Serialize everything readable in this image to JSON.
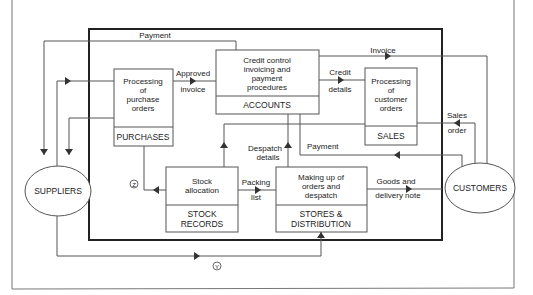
{
  "diagram": {
    "type": "data-flow-diagram",
    "entities": {
      "suppliers": "SUPPLIERS",
      "customers": "CUSTOMERS"
    },
    "processes": [
      {
        "id": "purchases",
        "text": [
          "Processing",
          "of",
          "purchase",
          "orders"
        ],
        "department": "PURCHASES"
      },
      {
        "id": "accounts",
        "text": [
          "Credit control",
          "invoicing and",
          "payment",
          "procedures"
        ],
        "department": "ACCOUNTS"
      },
      {
        "id": "sales",
        "text": [
          "Processing",
          "of",
          "customer",
          "orders"
        ],
        "department": "SALES"
      },
      {
        "id": "stock",
        "text": [
          "Stock",
          "allocation"
        ],
        "department": [
          "STOCK",
          "RECORDS"
        ]
      },
      {
        "id": "stores",
        "text": [
          "Making up of",
          "orders and",
          "despatch"
        ],
        "department": [
          "STORES &",
          "DISTRIBUTION"
        ]
      }
    ],
    "flows": {
      "payment_top": "Payment",
      "approved_invoice": [
        "Approved",
        "invoice"
      ],
      "invoice": "Invoice",
      "credit_details": [
        "Credit",
        "details"
      ],
      "sales_order": [
        "Sales",
        "order"
      ],
      "payment_mid": "Payment",
      "despatch_details": [
        "Despatch",
        "details"
      ],
      "packing_list": [
        "Packing",
        "list"
      ],
      "goods_delivery": [
        "Goods and",
        "delivery note"
      ],
      "marker_z": "Z",
      "marker_y": "Y"
    }
  }
}
